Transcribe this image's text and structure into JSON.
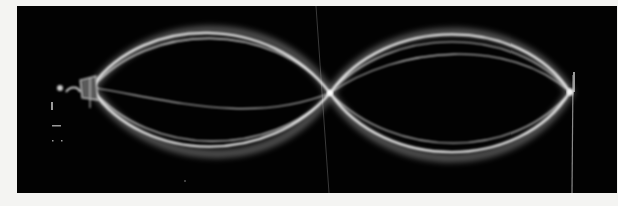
{
  "image": {
    "subject": "long-exposure photograph of a vibrating string showing a standing wave (two antinodes, one central node)",
    "background_color": "#020202",
    "border_color": "#f4f4f2",
    "string_color": "#e8e8e8",
    "nodes": [
      {
        "name": "left-clamp",
        "x": 92,
        "y": 88
      },
      {
        "name": "center-node",
        "x": 330,
        "y": 93
      },
      {
        "name": "right-end",
        "x": 570,
        "y": 92
      }
    ],
    "antinodes": [
      {
        "name": "left-lobe",
        "x": 210,
        "top_y": 27,
        "bottom_y": 153
      },
      {
        "name": "right-lobe",
        "x": 450,
        "top_y": 30,
        "bottom_y": 160
      }
    ]
  }
}
